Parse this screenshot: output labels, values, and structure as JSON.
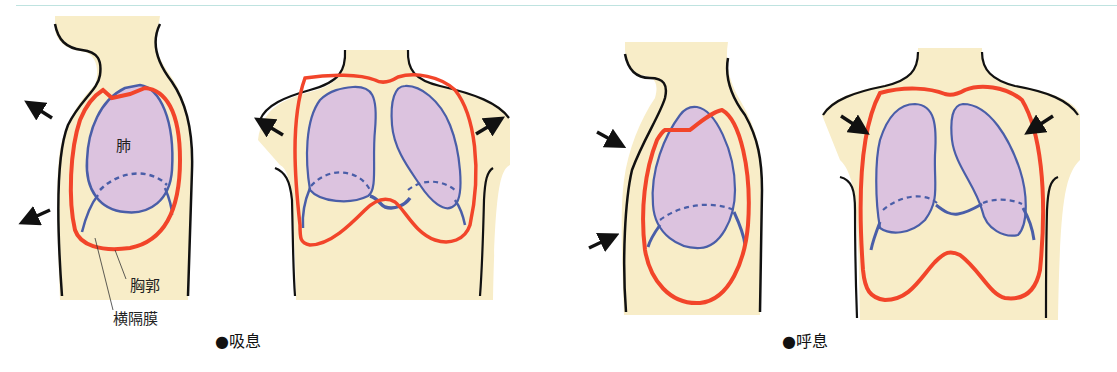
{
  "diagram": {
    "topic": "Respiration: inspiration vs expiration",
    "colors": {
      "skin": "#f8edc8",
      "ribcage": "#f2452a",
      "lung_outline": "#4a5ea8",
      "lung_fill": "#dcc3df",
      "outline": "#111111",
      "rule": "#bfe3e0"
    },
    "labels": {
      "lung": "肺",
      "ribcage": "胸郭",
      "diaphragm": "横隔膜"
    },
    "panels": [
      {
        "id": "inspiration",
        "caption": "●吸息",
        "arrows": "outward"
      },
      {
        "id": "expiration",
        "caption": "●呼息",
        "arrows": "inward"
      }
    ]
  }
}
